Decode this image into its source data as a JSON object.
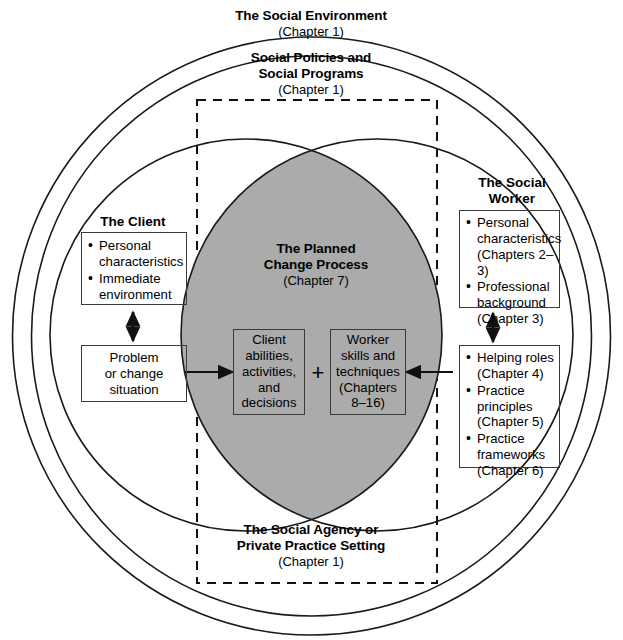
{
  "figure": {
    "type": "concentric-venn-diagram",
    "fill_color": "#ababab",
    "stroke_color": "#1a1a1a"
  },
  "outer_labels": {
    "social_environment": {
      "title": "The Social Environment",
      "chapter": "(Chapter 1)"
    },
    "social_policies": {
      "title_line1": "Social Policies and",
      "title_line2": "Social Programs",
      "chapter": "(Chapter 1)"
    },
    "social_agency": {
      "title_line1": "The Social Agency or",
      "title_line2": "Private Practice Setting",
      "chapter": "(Chapter 1)"
    }
  },
  "client": {
    "group_title": "The Client",
    "attributes_box": [
      "Personal",
      "characteristics",
      "Immediate",
      "environment"
    ],
    "attributes_items": [
      {
        "line1": "Personal",
        "line2": "characteristics"
      },
      {
        "line1": "Immediate",
        "line2": "environment"
      }
    ],
    "problem_box": {
      "line1": "Problem",
      "line2": "or change",
      "line3": "situation"
    }
  },
  "social_worker": {
    "group_title_line1": "The Social",
    "group_title_line2": "Worker",
    "attributes_items": [
      {
        "line1": "Personal",
        "line2": "characteristics",
        "line3": "(Chapters 2–3)"
      },
      {
        "line1": "Professional",
        "line2": "background",
        "line3": "(Chapter 3)"
      }
    ],
    "practice_items": [
      {
        "line1": "Helping roles",
        "line2": "(Chapter 4)"
      },
      {
        "line1": "Practice",
        "line2": "principles",
        "line3": "(Chapter 5)"
      },
      {
        "line1": "Practice",
        "line2": "frameworks",
        "line3": "(Chapter 6)"
      }
    ]
  },
  "planned_change": {
    "title_line1": "The Planned",
    "title_line2": "Change Process",
    "chapter": "(Chapter 7)",
    "client_box": {
      "line1": "Client",
      "line2": "abilities,",
      "line3": "activities,",
      "line4": "and",
      "line5": "decisions"
    },
    "operator": "+",
    "worker_box": {
      "line1": "Worker",
      "line2": "skills and",
      "line3": "techniques",
      "line4": "(Chapters",
      "line5": "8–16)"
    }
  }
}
